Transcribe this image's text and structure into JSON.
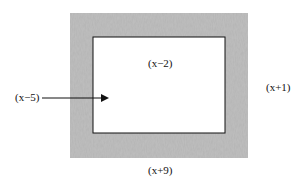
{
  "diagram": {
    "type": "nested-rectangles",
    "outer_rect": {
      "width_label": "(x+9)",
      "height_label": "(x+1)",
      "fill": "#b8b8b8",
      "style": "textured gray border region"
    },
    "inner_rect": {
      "width_label": "(x-2)",
      "height_label": "(x-5)",
      "fill": "#ffffff",
      "stroke": "#111111"
    },
    "labels": {
      "inner_width": "(x−2)",
      "outer_height": "(x+1)",
      "inner_height": "(x−5)",
      "outer_width": "(x+9)"
    },
    "arrow": {
      "from_label": "inner_height",
      "points_to": "inner_rect"
    }
  }
}
